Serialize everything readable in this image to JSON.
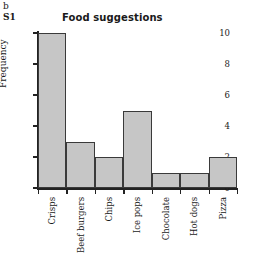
{
  "panel": {
    "letter": "b",
    "series_label": "S1"
  },
  "chart_data": {
    "type": "bar",
    "title": "Food suggestions",
    "xlabel": "",
    "ylabel": "Frequency",
    "categories": [
      "Crisps",
      "Beef burgers",
      "Chips",
      "Ice pops",
      "Chocolate",
      "Hot dogs",
      "Pizza"
    ],
    "values": [
      10,
      3,
      2,
      5,
      1,
      1,
      2
    ],
    "ylim": [
      0,
      10
    ],
    "yticks": [
      0,
      2,
      4,
      6,
      8,
      10
    ],
    "ytick_labels": [
      "0",
      "2",
      "4",
      "6",
      "8",
      "10"
    ],
    "grid": false,
    "legend": null,
    "bar_fill_color": "#c6c6c6",
    "bar_edge_color": "#3a3a3a",
    "axis_color": "#222222",
    "background_color": "#ffffff"
  },
  "footer": {
    "cut_off_text": ""
  }
}
